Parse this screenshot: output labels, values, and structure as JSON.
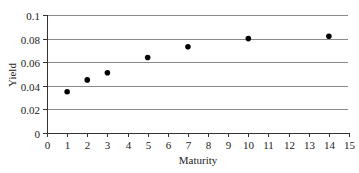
{
  "chart_data": {
    "type": "scatter",
    "title": "",
    "xlabel": "Maturity",
    "ylabel": "Yield",
    "xlim": [
      0,
      15
    ],
    "ylim": [
      0,
      0.1
    ],
    "x_ticks": [
      "0",
      "1",
      "2",
      "3",
      "4",
      "5",
      "6",
      "7",
      "8",
      "9",
      "10",
      "11",
      "12",
      "13",
      "14",
      "15"
    ],
    "y_ticks": [
      "0",
      "0.02",
      "0.04",
      "0.06",
      "0.08",
      "0.1"
    ],
    "grid": "horizontal",
    "legend": null,
    "series": [
      {
        "name": "Yield",
        "points": [
          {
            "x": 1,
            "y": 0.035
          },
          {
            "x": 2,
            "y": 0.045
          },
          {
            "x": 3,
            "y": 0.051
          },
          {
            "x": 5,
            "y": 0.064
          },
          {
            "x": 7,
            "y": 0.073
          },
          {
            "x": 10,
            "y": 0.08
          },
          {
            "x": 14,
            "y": 0.082
          }
        ]
      }
    ],
    "colors": {
      "grid": "#8a8a8a",
      "axis": "#333333",
      "marker": "#000000"
    }
  }
}
